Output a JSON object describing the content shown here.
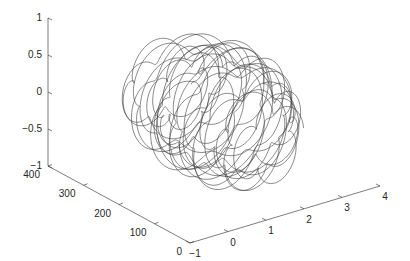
{
  "chart_data": {
    "type": "line3d",
    "title": "",
    "xlabel": "",
    "ylabel": "",
    "zlabel": "",
    "x_axis": {
      "range": [
        -1,
        4
      ],
      "ticks": [
        -1,
        0,
        1,
        2,
        3,
        4
      ],
      "tick_labels": [
        "−1",
        "0",
        "1",
        "2",
        "3",
        "4"
      ]
    },
    "y_axis": {
      "range": [
        0,
        400
      ],
      "ticks": [
        0,
        100,
        200,
        300,
        400
      ],
      "tick_labels": [
        "0",
        "100",
        "200",
        "300",
        "400"
      ]
    },
    "z_axis": {
      "range": [
        -1,
        1
      ],
      "ticks": [
        -1,
        -0.5,
        0,
        0.5,
        1
      ],
      "tick_labels": [
        "−1",
        "−0.5",
        "0",
        "0.5",
        "1"
      ]
    },
    "grid": false,
    "legend": null,
    "series": [
      {
        "name": "curve",
        "description": "Looping 3D parametric curve (epicycloid-like coils) spanning x approx 0..3.5, y approx 50..350, z approx -0.9..0.6",
        "color": "#3a3a3a",
        "param": {
          "loops": 22,
          "x_center": 1.6,
          "x_amp": 1.4,
          "z_amp": 0.75,
          "small_loop_ratio": 0.18,
          "y_start": 60,
          "y_end": 340
        }
      }
    ]
  }
}
